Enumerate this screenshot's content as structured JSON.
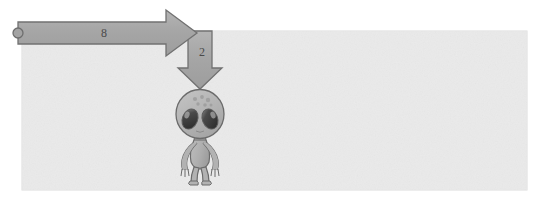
{
  "scene": {
    "title": "alien-with-arrows-diagram",
    "canvas": {
      "width": 543,
      "height": 202,
      "background": "#ffffff"
    },
    "field": {
      "name": "background-panel",
      "x": 22,
      "y": 31,
      "width": 505,
      "height": 159,
      "fill": "#eaeaea",
      "stroke": "#d8d8d8"
    }
  },
  "arrows": {
    "horizontal": {
      "label": "8",
      "direction": "right",
      "fill": "#a8a8a8",
      "stroke": "#6e6e6e",
      "tail_marker": "circle-endpoint",
      "tail_x": 18,
      "tail_y": 33,
      "tip_x": 197,
      "tip_y": 33
    },
    "vertical": {
      "label": "2",
      "direction": "down",
      "fill": "#a8a8a8",
      "stroke": "#6e6e6e",
      "tail_x": 200,
      "tail_y": 33,
      "tip_x": 200,
      "tip_y": 88
    }
  },
  "character": {
    "name": "grey-alien",
    "body_fill": "#b5b5b5",
    "body_stroke": "#6b6b6b",
    "eye_fill": "#3a3a3a",
    "eye_highlight": "#9a9a9a",
    "head_spots": 6,
    "center_x": 200,
    "head_y": 113,
    "feet_y": 180
  }
}
